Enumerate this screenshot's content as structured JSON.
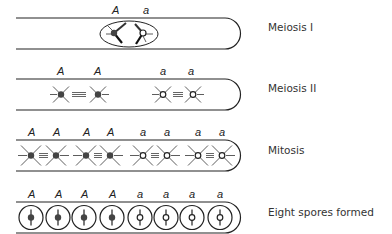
{
  "stages": [
    {
      "id": "meiosis-1",
      "label": "Meiosis I",
      "alleles": [
        "A",
        "a"
      ]
    },
    {
      "id": "meiosis-2",
      "label": "Meiosis II",
      "alleles": [
        "A",
        "A",
        "a",
        "a"
      ]
    },
    {
      "id": "mitosis",
      "label": "Mitosis",
      "alleles": [
        "A",
        "A",
        "A",
        "A",
        "a",
        "a",
        "a",
        "a"
      ]
    },
    {
      "id": "spores",
      "label": "Eight spores formed",
      "alleles": [
        "A",
        "A",
        "A",
        "A",
        "a",
        "a",
        "a",
        "a"
      ]
    }
  ],
  "colors": {
    "line": "#222222",
    "dark_nucleus": "#444444",
    "light_nucleus": "#ffffff"
  }
}
